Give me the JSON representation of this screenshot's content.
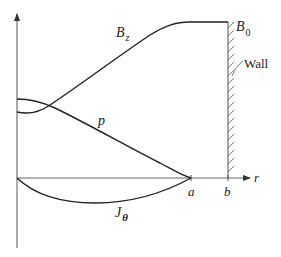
{
  "diagram": {
    "colors": {
      "stroke": "#222222",
      "axis": "#555555",
      "background": "#ffffff"
    },
    "axes": {
      "x_label": "r",
      "ticks": [
        {
          "label": "a"
        },
        {
          "label": "b"
        }
      ]
    },
    "curves": [
      {
        "name": "B_z",
        "label_main": "B",
        "label_sub": "z",
        "description": "rises from a nonzero value at r=0 to plateau B0 before wall"
      },
      {
        "name": "p",
        "label_main": "p",
        "description": "pressure decreases from max at r=0 to zero at r=a"
      },
      {
        "name": "J_theta",
        "label_main": "J",
        "label_sub": "θ",
        "description": "negative current density between 0 and a"
      }
    ],
    "annotations": {
      "b0_main": "B",
      "b0_sub": "0",
      "wall": "Wall"
    }
  }
}
